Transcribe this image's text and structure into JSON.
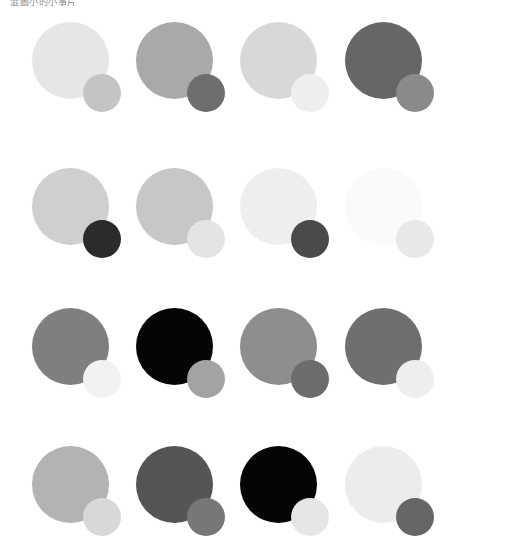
{
  "caption": "混圖小的小事片",
  "grid": {
    "columns": 4,
    "rows": 4,
    "cells": [
      {
        "row": 1,
        "col": 1,
        "big": "#e6e6e6",
        "small": "#c4c4c4"
      },
      {
        "row": 1,
        "col": 2,
        "big": "#a9a9a9",
        "small": "#6e6e6e"
      },
      {
        "row": 1,
        "col": 3,
        "big": "#d8d8d8",
        "small": "#eeeeee"
      },
      {
        "row": 1,
        "col": 4,
        "big": "#666666",
        "small": "#8a8a8a"
      },
      {
        "row": 2,
        "col": 1,
        "big": "#cfcfcf",
        "small": "#2b2b2b"
      },
      {
        "row": 2,
        "col": 2,
        "big": "#c7c7c7",
        "small": "#e4e4e4"
      },
      {
        "row": 2,
        "col": 3,
        "big": "#eeeeee",
        "small": "#4a4a4a"
      },
      {
        "row": 2,
        "col": 4,
        "big": "#fafafa",
        "small": "#e8e8e8"
      },
      {
        "row": 3,
        "col": 1,
        "big": "#7f7f7f",
        "small": "#f2f2f2"
      },
      {
        "row": 3,
        "col": 2,
        "big": "#050505",
        "small": "#a3a3a3"
      },
      {
        "row": 3,
        "col": 3,
        "big": "#8e8e8e",
        "small": "#6c6c6c"
      },
      {
        "row": 3,
        "col": 4,
        "big": "#6f6f6f",
        "small": "#eeeeee"
      },
      {
        "row": 4,
        "col": 1,
        "big": "#b3b3b3",
        "small": "#d8d8d8"
      },
      {
        "row": 4,
        "col": 2,
        "big": "#555555",
        "small": "#777777"
      },
      {
        "row": 4,
        "col": 3,
        "big": "#050505",
        "small": "#e6e6e6"
      },
      {
        "row": 4,
        "col": 4,
        "big": "#ececec",
        "small": "#666666"
      }
    ]
  }
}
